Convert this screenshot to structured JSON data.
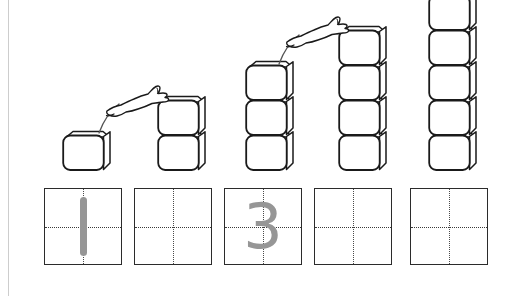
{
  "worksheet": {
    "title": "Counting and Number Writing Practice 1 to 5",
    "background_color": "#ffffff",
    "page_border_color": "#cdcdcd",
    "width": 516,
    "height": 296
  },
  "colors": {
    "cube_outline": "#1a1a1a",
    "cube_fill": "#ffffff",
    "grid_border": "#2b2b2b",
    "grid_guide": "#3a3a3a",
    "numeral_gray": "#969696",
    "animal_outline": "#1a1a1a",
    "motion_arc": "#555555"
  },
  "towers": [
    {
      "name": "tower-1",
      "count": 1,
      "label": "1",
      "x": 62,
      "base_y": 170
    },
    {
      "name": "tower-2",
      "count": 2,
      "label": "2",
      "x": 157,
      "base_y": 170
    },
    {
      "name": "tower-3",
      "count": 3,
      "label": "3",
      "x": 245,
      "base_y": 170
    },
    {
      "name": "tower-4",
      "count": 4,
      "label": "4",
      "x": 338,
      "base_y": 170
    },
    {
      "name": "tower-5",
      "count": 5,
      "label": "5",
      "x": 428,
      "base_y": 170
    }
  ],
  "animals": [
    {
      "name": "leaping-animal-1",
      "species": "rabbit",
      "from_tower": 1,
      "to_tower": 2
    },
    {
      "name": "leaping-animal-2",
      "species": "rabbit",
      "from_tower": 3,
      "to_tower": 4
    }
  ],
  "grid_boxes": [
    {
      "name": "grid-box-1",
      "index": 1,
      "x": 44,
      "y": 188,
      "numeral": "1",
      "filled": true
    },
    {
      "name": "grid-box-2",
      "index": 2,
      "x": 134,
      "y": 188,
      "numeral": "",
      "filled": false
    },
    {
      "name": "grid-box-3",
      "index": 3,
      "x": 224,
      "y": 188,
      "numeral": "3",
      "filled": true
    },
    {
      "name": "grid-box-4",
      "index": 4,
      "x": 314,
      "y": 188,
      "numeral": "",
      "filled": false
    },
    {
      "name": "grid-box-5",
      "index": 5,
      "x": 410,
      "y": 188,
      "numeral": "",
      "filled": false
    }
  ]
}
